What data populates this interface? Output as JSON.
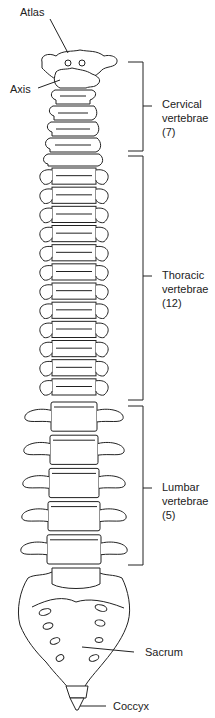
{
  "diagram": {
    "labels": {
      "atlas": "Atlas",
      "axis": "Axis",
      "cervical": [
        "Cervical",
        "vertebrae",
        "(7)"
      ],
      "thoracic": [
        "Thoracic",
        "vertebrae",
        "(12)"
      ],
      "lumbar": [
        "Lumbar",
        "vertebrae",
        "(5)"
      ],
      "sacrum": "Sacrum",
      "coccyx": "Coccyx"
    },
    "regions": [
      {
        "name": "Cervical vertebrae",
        "count": 7
      },
      {
        "name": "Thoracic vertebrae",
        "count": 12
      },
      {
        "name": "Lumbar vertebrae",
        "count": 5
      }
    ],
    "colors": {
      "line": "#222222",
      "background": "#ffffff"
    }
  }
}
